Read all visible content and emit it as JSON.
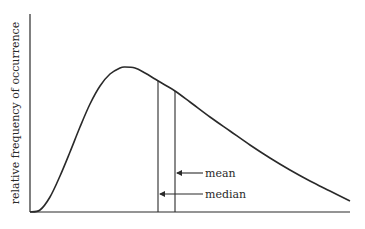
{
  "chart_data": {
    "type": "line",
    "title": "",
    "xlabel": "",
    "ylabel": "relative frequency of occurrence",
    "grid": false,
    "legend": null,
    "axes": {
      "y_axis": {
        "x": 30,
        "y_top": 14,
        "y_bottom": 212
      },
      "x_axis": {
        "y": 212,
        "x_left": 30,
        "x_right": 350
      }
    },
    "series": [
      {
        "name": "distribution",
        "points_px": [
          [
            30,
            212
          ],
          [
            40,
            210
          ],
          [
            50,
            197
          ],
          [
            60,
            176
          ],
          [
            70,
            152
          ],
          [
            80,
            127
          ],
          [
            90,
            104
          ],
          [
            100,
            86
          ],
          [
            110,
            74
          ],
          [
            120,
            68
          ],
          [
            125,
            67
          ],
          [
            135,
            68
          ],
          [
            145,
            73
          ],
          [
            155,
            79
          ],
          [
            165,
            85
          ],
          [
            175,
            91
          ],
          [
            190,
            102
          ],
          [
            210,
            117
          ],
          [
            230,
            131
          ],
          [
            250,
            145
          ],
          [
            270,
            158
          ],
          [
            290,
            170
          ],
          [
            310,
            181
          ],
          [
            330,
            191
          ],
          [
            350,
            201
          ]
        ]
      }
    ],
    "markers": [
      {
        "label": "median",
        "x": 158,
        "y_top": 81,
        "arrow_y": 194
      },
      {
        "label": "mean",
        "x": 175,
        "y_top": 91,
        "arrow_y": 173
      }
    ],
    "annotations": [
      "mean",
      "median"
    ]
  },
  "labels": {
    "ylabel": "relative frequency of occurrence",
    "mean": "mean",
    "median": "median"
  },
  "colors": {
    "line": "#2a2a2a",
    "background": "#ffffff"
  }
}
